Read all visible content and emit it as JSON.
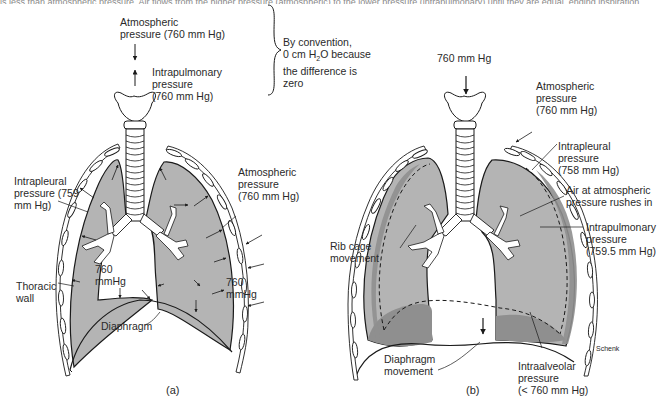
{
  "top_strip": {
    "text": "is less than atmospheric pressure. Air flows from the higher pressure (atmospheric) to the lower pressure (intrapulmonary) until they are equal, ending inspiration."
  },
  "colors": {
    "lung_fill": "#b4b4b4",
    "lung_dark_fill": "#8f8f8f",
    "outline": "#1a1a1a",
    "background": "#ffffff"
  },
  "panel_a": {
    "caption": "(a)",
    "atmospheric_top": "Atmospheric\npressure (760 mm Hg)",
    "intrapulmonary": "Intrapulmonary\npressure\n(760 mm Hg)",
    "convention_note": "By convention,\n0 cm H₂O because\nthe difference is\nzero",
    "intrapleural": "Intrapleural\npressure (759\nmm Hg)",
    "atmospheric_right": "Atmospheric\npressure\n(760 mm Hg)",
    "left_lung_pressure": "760\nmmHg",
    "right_lung_pressure": "760\nmmHg",
    "thoracic_wall": "Thoracic\nwall",
    "diaphragm": "Diaphragm"
  },
  "panel_b": {
    "caption": "(b)",
    "top_pressure": "760 mm Hg",
    "atmospheric": "Atmospheric\npressure\n(760 mm Hg)",
    "intrapleural": "Intrapleural\npressure\n(758 mm Hg)",
    "air_rushes": "Air at atmospheric\npressure rushes in",
    "intrapulmonary": "Intrapulmonary\npressure\n(759.5 mm Hg)",
    "rib_cage": "Rib cage\nmovement",
    "diaphragm_movement": "Diaphragm\nmovement",
    "intraalveolar": "Intraalveolar\npressure\n(< 760 mm Hg)",
    "artist": "Schenk"
  }
}
